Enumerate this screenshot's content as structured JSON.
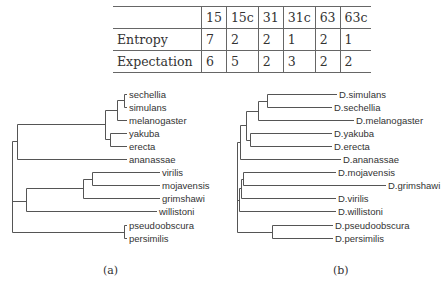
{
  "table": {
    "columns": [
      "",
      "15",
      "15c",
      "31",
      "31c",
      "63",
      "63c"
    ],
    "rows": [
      {
        "label": "Entropy",
        "values": [
          "7",
          "2",
          "2",
          "1",
          "2",
          "1"
        ]
      },
      {
        "label": "Expectation",
        "values": [
          "6",
          "5",
          "2",
          "3",
          "2",
          "2"
        ]
      }
    ]
  },
  "tree_a": {
    "caption": "(a)",
    "leaves": [
      "sechellia",
      "simulans",
      "melanogaster",
      "yakuba",
      "erecta",
      "ananassae",
      "virilis",
      "mojavensis",
      "grimshawi",
      "willistoni",
      "pseudoobscura",
      "persimilis"
    ]
  },
  "tree_b": {
    "caption": "(b)",
    "leaves": [
      "D.simulans",
      "D.sechellia",
      "D.melanogaster",
      "D.yakuba",
      "D.erecta",
      "D.ananassae",
      "D.mojavensis",
      "D.grimshawi",
      "D.virilis",
      "D.willistoni",
      "D.pseudoobscura",
      "D.persimilis"
    ]
  }
}
